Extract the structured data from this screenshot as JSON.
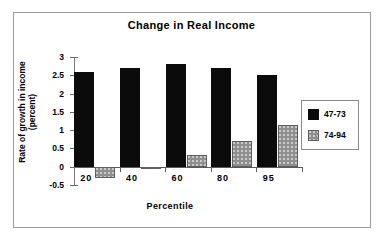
{
  "chart_data": {
    "type": "bar",
    "title": "Change in Real Income",
    "xlabel": "Percentile",
    "ylabel": "Rate of growth in income\n(percent)",
    "ylabel_line1": "Rate of growth in income",
    "ylabel_line2": "(percent)",
    "categories": [
      "20",
      "40",
      "60",
      "80",
      "95"
    ],
    "series": [
      {
        "name": "47-73",
        "color": "#0b0b0b",
        "values": [
          2.6,
          2.7,
          2.8,
          2.7,
          2.5
        ]
      },
      {
        "name": "74-94",
        "color": "#8f8f8f",
        "values": [
          -0.3,
          -0.02,
          0.32,
          0.7,
          1.15
        ]
      }
    ],
    "ylim": [
      -0.5,
      3
    ],
    "yticks": [
      "3",
      "2.5",
      "2",
      "1.5",
      "1",
      "0.5",
      "0",
      "-0.5"
    ],
    "ytick_values": [
      3,
      2.5,
      2,
      1.5,
      1,
      0.5,
      0,
      -0.5
    ],
    "grid": false,
    "legend_position": "right",
    "legend_entries": [
      "47-73",
      "74-94"
    ]
  }
}
